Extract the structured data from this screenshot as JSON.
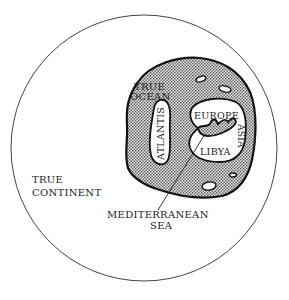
{
  "diagram": {
    "type": "map-diagram",
    "labels": {
      "true_ocean_line1": "TRUE",
      "true_ocean_line2": "OCEAN",
      "atlantis": "ATLANTIS",
      "europe": "EUROPE",
      "asia": "ASIA",
      "libya": "LIBYA",
      "true_continent_line1": "TRUE",
      "true_continent_line2": "CONTINENT",
      "mediterranean_line1": "MEDITERRANEAN",
      "mediterranean_line2": "SEA"
    },
    "colors": {
      "line": "#222222",
      "ocean_fill": "#bdbdbd",
      "land_fill": "#ffffff",
      "background": "#ffffff"
    }
  }
}
